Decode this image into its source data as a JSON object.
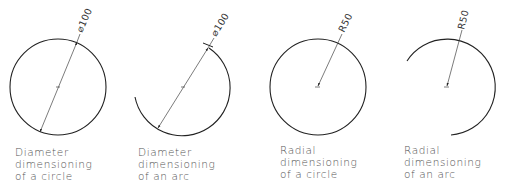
{
  "figures": [
    {
      "id": "diameter-circle",
      "dimension_label": "⌀100",
      "caption": [
        "Diameter",
        "dimensioning",
        "of a circle"
      ]
    },
    {
      "id": "diameter-arc",
      "dimension_label": "⌀100",
      "caption": [
        "Diameter",
        "dimensioning",
        "of an arc"
      ]
    },
    {
      "id": "radial-circle",
      "dimension_label": "R50",
      "caption": [
        "Radial",
        "dimensioning",
        "of a circle"
      ]
    },
    {
      "id": "radial-arc",
      "dimension_label": "R50",
      "caption": [
        "Radial",
        "dimensioning",
        "of an arc"
      ]
    }
  ],
  "colors": {
    "line": "#222222",
    "text": "#555555",
    "background": "#ffffff"
  }
}
